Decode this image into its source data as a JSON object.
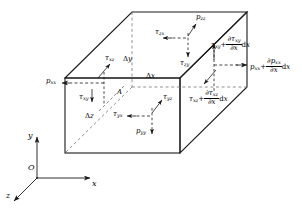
{
  "figure": {
    "type": "stress-element-diagram",
    "background": "#ffffff",
    "line_color": "#1a1a1a"
  },
  "axes": {
    "origin_label": "O",
    "x_label": "x",
    "y_label": "y",
    "z_label": "z"
  },
  "dimensions": {
    "dx": {
      "delta": "Δ",
      "var": "x"
    },
    "dy": {
      "delta": "Δ",
      "var": "y"
    },
    "dz": {
      "delta": "Δ",
      "var": "z"
    }
  },
  "point": {
    "label": "A"
  },
  "stresses": {
    "left_face": {
      "normal": {
        "base": "p",
        "sub": "xx"
      },
      "shear_z": {
        "base": "τ",
        "sub": "xz"
      },
      "shear_y": {
        "base": "τ",
        "sub": "xy"
      }
    },
    "top_face": {
      "normal": {
        "base": "p",
        "sub": "zz"
      },
      "shear_x": {
        "base": "τ",
        "sub": "zx"
      },
      "shear_y": {
        "base": "τ",
        "sub": "zy"
      }
    },
    "bottom_face": {
      "normal": {
        "base": "p",
        "sub": "yy"
      },
      "shear_x": {
        "base": "τ",
        "sub": "yx"
      },
      "shear_z": {
        "base": "τ",
        "sub": "yz"
      }
    },
    "right_face": {
      "shear_xy": {
        "base": "τ",
        "sub": "xy",
        "plus": "+",
        "num_d": "∂",
        "num_base": "τ",
        "num_sub": "xy",
        "den_d": "∂",
        "den_var": "x",
        "tail_d": "d",
        "tail_var": "x"
      },
      "normal_xx": {
        "base": "p",
        "sub": "xx",
        "plus": "+",
        "num_d": "∂",
        "num_base": "p",
        "num_sub": "xx",
        "den_d": "∂",
        "den_var": "x",
        "tail_d": "d",
        "tail_var": "x"
      },
      "shear_xz": {
        "base": "τ",
        "sub": "xz",
        "plus": "+",
        "num_d": "∂",
        "num_base": "τ",
        "num_sub": "xz",
        "den_d": "∂",
        "den_var": "x",
        "tail_d": "d",
        "tail_var": "x"
      }
    }
  }
}
